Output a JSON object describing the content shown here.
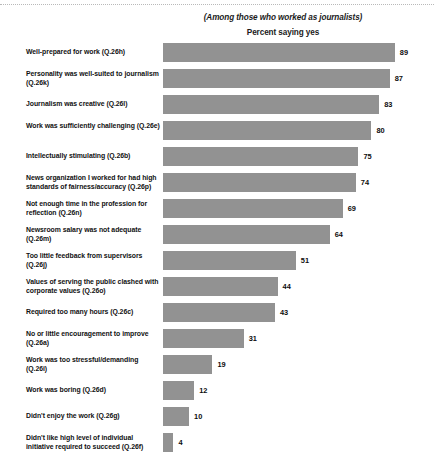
{
  "header": {
    "subtitle": "(Among those who worked as journalists)",
    "axis_title": "Percent saying yes"
  },
  "chart_data": {
    "type": "bar",
    "orientation": "horizontal",
    "title": "",
    "subtitle": "(Among those who worked as journalists)",
    "xlabel": "Percent saying yes",
    "ylabel": "",
    "xlim": [
      0,
      100
    ],
    "grid": false,
    "legend": false,
    "bar_color": "#929292",
    "categories": [
      "Well-prepared for work (Q.26h)",
      "Personality was well-suited to journalism (Q.26k)",
      "Journalism was creative (Q.26l)",
      "Work was sufficiently challenging (Q.26e)",
      "Intellectually stimulating (Q.26b)",
      "News organization I worked for had high standards of fairness/accuracy (Q.26p)",
      "Not enough time in the profession for reflection (Q.26n)",
      "Newsroom salary was not adequate (Q.26m)",
      "Too little feedback from supervisors (Q.26j)",
      "Values of serving the public clashed with corporate values (Q.26o)",
      "Required too many hours (Q.26c)",
      "No or little encouragement to improve (Q.26a)",
      "Work was too stressful/demanding  (Q.26i)",
      "Work was boring (Q.26d)",
      "Didn't enjoy the work (Q.26g)",
      "Didn't like high level of individual initiative required to succeed  (Q.26f)"
    ],
    "values": [
      89,
      87,
      83,
      80,
      75,
      74,
      69,
      64,
      51,
      44,
      43,
      31,
      19,
      12,
      10,
      4
    ]
  },
  "rows": [
    {
      "label": "Well-prepared for work (Q.26h)",
      "value": "89",
      "pct": 89,
      "h": 26,
      "lines": 1
    },
    {
      "label": "Personality was well-suited to journalism (Q.26k)",
      "value": "87",
      "pct": 87,
      "h": 26,
      "lines": 2
    },
    {
      "label": "Journalism was creative (Q.26l)",
      "value": "83",
      "pct": 83,
      "h": 26,
      "lines": 1
    },
    {
      "label": "Work was sufficiently challenging (Q.26e)",
      "value": "80",
      "pct": 80,
      "h": 26,
      "lines": 2
    },
    {
      "label": "Intellectually stimulating (Q.26b)",
      "value": "75",
      "pct": 75,
      "h": 26,
      "lines": 1
    },
    {
      "label": "News organization I worked for had high standards of fairness/accuracy (Q.26p)",
      "value": "74",
      "pct": 74,
      "h": 26,
      "lines": 2
    },
    {
      "label": "Not enough time in the profession for reflection (Q.26n)",
      "value": "69",
      "pct": 69,
      "h": 26,
      "lines": 2
    },
    {
      "label": "Newsroom salary was not adequate (Q.26m)",
      "value": "64",
      "pct": 64,
      "h": 26,
      "lines": 2
    },
    {
      "label": "Too little feedback from supervisors (Q.26j)",
      "value": "51",
      "pct": 51,
      "h": 26,
      "lines": 2
    },
    {
      "label": "Values of serving the public clashed with corporate values (Q.26o)",
      "value": "44",
      "pct": 44,
      "h": 26,
      "lines": 2
    },
    {
      "label": "Required too many hours (Q.26c)",
      "value": "43",
      "pct": 43,
      "h": 26,
      "lines": 1
    },
    {
      "label": "No or little encouragement to improve (Q.26a)",
      "value": "31",
      "pct": 31,
      "h": 26,
      "lines": 2
    },
    {
      "label": "Work was too stressful/demanding  (Q.26i)",
      "value": "19",
      "pct": 19,
      "h": 26,
      "lines": 2
    },
    {
      "label": "Work was boring (Q.26d)",
      "value": "12",
      "pct": 12,
      "h": 26,
      "lines": 1
    },
    {
      "label": "Didn't enjoy the work (Q.26g)",
      "value": "10",
      "pct": 10,
      "h": 26,
      "lines": 1
    },
    {
      "label": "Didn't like high level of individual initiative required to succeed  (Q.26f)",
      "value": "4",
      "pct": 4,
      "h": 26,
      "lines": 2
    }
  ]
}
